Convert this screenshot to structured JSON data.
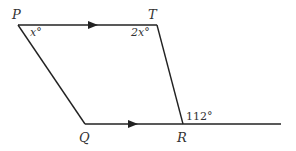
{
  "diagram": {
    "type": "geometry",
    "points": {
      "P": {
        "label": "P",
        "x": 18,
        "y": 25
      },
      "T": {
        "label": "T",
        "x": 157,
        "y": 25
      },
      "Q": {
        "label": "Q",
        "x": 85,
        "y": 124
      },
      "R": {
        "label": "R",
        "x": 183,
        "y": 124
      },
      "E": {
        "x": 281,
        "y": 124
      }
    },
    "angles": {
      "P": "x°",
      "T": "2x°",
      "R_exterior": "112°"
    },
    "parallel_marks": [
      "PT",
      "QR"
    ],
    "line_color": "#222222"
  }
}
